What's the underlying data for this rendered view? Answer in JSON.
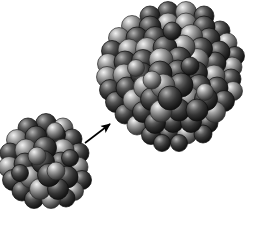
{
  "figure": {
    "caption": "Small spherical atomic cluster transforming into a larger spherical atomic cluster",
    "background_color": "#ffffff",
    "width": 254,
    "height": 231
  },
  "palette": {
    "background": "#ffffff",
    "sphere_dark_base": "#2b2b2b",
    "sphere_dark_highlight": "#9a9a9a",
    "sphere_dark_edge": "#0d0d0d",
    "sphere_light_base": "#6e6e6e",
    "sphere_light_highlight": "#e2e2e2",
    "sphere_light_edge": "#2a2a2a",
    "arrow_color": "#000000"
  },
  "objects": {
    "small_cluster": {
      "label": "small atomic cluster",
      "center_x": 47,
      "center_y": 160,
      "radius": 42,
      "atom_count": 34,
      "atom_radius": 10.5
    },
    "large_cluster": {
      "label": "large atomic cluster",
      "center_x": 176,
      "center_y": 78,
      "radius": 68,
      "atom_count": 78,
      "atom_radius": 10.5
    },
    "arrow": {
      "label": "growth-transformation arrow",
      "x1": 85,
      "y1": 143,
      "x2": 110,
      "y2": 124,
      "stroke_width": 1.6,
      "head_length": 11,
      "head_width": 7
    }
  },
  "clusters": {
    "small": {
      "atoms": [
        {
          "x": 28,
          "y": 128,
          "r": 10.0,
          "tone": "dark",
          "depth": 0
        },
        {
          "x": 46,
          "y": 124,
          "r": 10.5,
          "tone": "dark",
          "depth": 0
        },
        {
          "x": 63,
          "y": 128,
          "r": 10.0,
          "tone": "light",
          "depth": 0
        },
        {
          "x": 17,
          "y": 140,
          "r": 10.5,
          "tone": "light",
          "depth": 0
        },
        {
          "x": 36,
          "y": 137,
          "r": 11.0,
          "tone": "dark",
          "depth": 1
        },
        {
          "x": 55,
          "y": 135,
          "r": 10.5,
          "tone": "dark",
          "depth": 1
        },
        {
          "x": 72,
          "y": 139,
          "r": 10.0,
          "tone": "dark",
          "depth": 0
        },
        {
          "x": 10,
          "y": 153,
          "r": 10.0,
          "tone": "dark",
          "depth": 0
        },
        {
          "x": 26,
          "y": 150,
          "r": 11.0,
          "tone": "light",
          "depth": 1
        },
        {
          "x": 45,
          "y": 148,
          "r": 11.5,
          "tone": "dark",
          "depth": 2
        },
        {
          "x": 63,
          "y": 150,
          "r": 11.0,
          "tone": "light",
          "depth": 1
        },
        {
          "x": 79,
          "y": 153,
          "r": 10.0,
          "tone": "dark",
          "depth": 0
        },
        {
          "x": 9,
          "y": 167,
          "r": 10.5,
          "tone": "light",
          "depth": 0
        },
        {
          "x": 25,
          "y": 164,
          "r": 11.0,
          "tone": "dark",
          "depth": 1
        },
        {
          "x": 43,
          "y": 162,
          "r": 11.5,
          "tone": "dark",
          "depth": 2
        },
        {
          "x": 61,
          "y": 163,
          "r": 11.0,
          "tone": "dark",
          "depth": 1
        },
        {
          "x": 78,
          "y": 167,
          "r": 10.0,
          "tone": "light",
          "depth": 0
        },
        {
          "x": 13,
          "y": 180,
          "r": 10.5,
          "tone": "dark",
          "depth": 0
        },
        {
          "x": 31,
          "y": 177,
          "r": 11.0,
          "tone": "light",
          "depth": 1
        },
        {
          "x": 49,
          "y": 175,
          "r": 11.5,
          "tone": "dark",
          "depth": 2
        },
        {
          "x": 67,
          "y": 177,
          "r": 11.0,
          "tone": "dark",
          "depth": 1
        },
        {
          "x": 82,
          "y": 180,
          "r": 9.5,
          "tone": "dark",
          "depth": 0
        },
        {
          "x": 22,
          "y": 191,
          "r": 10.0,
          "tone": "dark",
          "depth": 0
        },
        {
          "x": 40,
          "y": 189,
          "r": 10.5,
          "tone": "light",
          "depth": 1
        },
        {
          "x": 58,
          "y": 189,
          "r": 10.5,
          "tone": "dark",
          "depth": 1
        },
        {
          "x": 74,
          "y": 191,
          "r": 9.5,
          "tone": "light",
          "depth": 0
        },
        {
          "x": 34,
          "y": 199,
          "r": 9.5,
          "tone": "dark",
          "depth": 0
        },
        {
          "x": 51,
          "y": 199,
          "r": 9.5,
          "tone": "light",
          "depth": 0
        },
        {
          "x": 66,
          "y": 198,
          "r": 9.0,
          "tone": "dark",
          "depth": 0
        },
        {
          "x": 55,
          "y": 131,
          "r": 8.5,
          "tone": "light",
          "depth": 3
        },
        {
          "x": 37,
          "y": 156,
          "r": 9.0,
          "tone": "light",
          "depth": 3
        },
        {
          "x": 56,
          "y": 171,
          "r": 9.0,
          "tone": "light",
          "depth": 3
        },
        {
          "x": 20,
          "y": 173,
          "r": 8.5,
          "tone": "dark",
          "depth": 3
        },
        {
          "x": 70,
          "y": 158,
          "r": 8.5,
          "tone": "dark",
          "depth": 3
        }
      ]
    },
    "large": {
      "atoms": [
        {
          "x": 150,
          "y": 16,
          "r": 10.0,
          "tone": "dark",
          "depth": 0
        },
        {
          "x": 168,
          "y": 12,
          "r": 10.5,
          "tone": "dark",
          "depth": 0
        },
        {
          "x": 186,
          "y": 12,
          "r": 10.5,
          "tone": "light",
          "depth": 0
        },
        {
          "x": 204,
          "y": 16,
          "r": 10.0,
          "tone": "dark",
          "depth": 0
        },
        {
          "x": 132,
          "y": 26,
          "r": 10.5,
          "tone": "light",
          "depth": 0
        },
        {
          "x": 150,
          "y": 27,
          "r": 11.0,
          "tone": "dark",
          "depth": 1
        },
        {
          "x": 168,
          "y": 24,
          "r": 11.0,
          "tone": "light",
          "depth": 1
        },
        {
          "x": 186,
          "y": 24,
          "r": 11.0,
          "tone": "light",
          "depth": 1
        },
        {
          "x": 204,
          "y": 27,
          "r": 11.0,
          "tone": "dark",
          "depth": 1
        },
        {
          "x": 220,
          "y": 31,
          "r": 10.0,
          "tone": "dark",
          "depth": 0
        },
        {
          "x": 119,
          "y": 38,
          "r": 10.5,
          "tone": "light",
          "depth": 0
        },
        {
          "x": 137,
          "y": 38,
          "r": 11.0,
          "tone": "dark",
          "depth": 1
        },
        {
          "x": 155,
          "y": 38,
          "r": 11.5,
          "tone": "dark",
          "depth": 2
        },
        {
          "x": 173,
          "y": 36,
          "r": 11.5,
          "tone": "dark",
          "depth": 2
        },
        {
          "x": 191,
          "y": 36,
          "r": 11.5,
          "tone": "light",
          "depth": 2
        },
        {
          "x": 209,
          "y": 39,
          "r": 11.0,
          "tone": "dark",
          "depth": 1
        },
        {
          "x": 227,
          "y": 43,
          "r": 10.0,
          "tone": "light",
          "depth": 0
        },
        {
          "x": 112,
          "y": 51,
          "r": 10.5,
          "tone": "dark",
          "depth": 0
        },
        {
          "x": 129,
          "y": 50,
          "r": 11.0,
          "tone": "light",
          "depth": 1
        },
        {
          "x": 147,
          "y": 49,
          "r": 11.5,
          "tone": "light",
          "depth": 2
        },
        {
          "x": 165,
          "y": 48,
          "r": 12.0,
          "tone": "dark",
          "depth": 3
        },
        {
          "x": 183,
          "y": 47,
          "r": 12.0,
          "tone": "light",
          "depth": 3
        },
        {
          "x": 201,
          "y": 49,
          "r": 11.5,
          "tone": "dark",
          "depth": 2
        },
        {
          "x": 219,
          "y": 52,
          "r": 11.0,
          "tone": "dark",
          "depth": 1
        },
        {
          "x": 235,
          "y": 56,
          "r": 9.5,
          "tone": "dark",
          "depth": 0
        },
        {
          "x": 108,
          "y": 64,
          "r": 10.5,
          "tone": "light",
          "depth": 0
        },
        {
          "x": 125,
          "y": 62,
          "r": 11.0,
          "tone": "dark",
          "depth": 1
        },
        {
          "x": 143,
          "y": 61,
          "r": 11.5,
          "tone": "dark",
          "depth": 2
        },
        {
          "x": 161,
          "y": 60,
          "r": 12.0,
          "tone": "light",
          "depth": 3
        },
        {
          "x": 179,
          "y": 59,
          "r": 12.0,
          "tone": "dark",
          "depth": 3
        },
        {
          "x": 197,
          "y": 60,
          "r": 11.5,
          "tone": "light",
          "depth": 2
        },
        {
          "x": 215,
          "y": 63,
          "r": 11.0,
          "tone": "dark",
          "depth": 1
        },
        {
          "x": 232,
          "y": 67,
          "r": 10.0,
          "tone": "light",
          "depth": 0
        },
        {
          "x": 107,
          "y": 77,
          "r": 10.5,
          "tone": "light",
          "depth": 0
        },
        {
          "x": 124,
          "y": 75,
          "r": 11.0,
          "tone": "light",
          "depth": 1
        },
        {
          "x": 142,
          "y": 74,
          "r": 11.5,
          "tone": "dark",
          "depth": 2
        },
        {
          "x": 160,
          "y": 73,
          "r": 12.0,
          "tone": "dark",
          "depth": 3
        },
        {
          "x": 178,
          "y": 72,
          "r": 12.0,
          "tone": "dark",
          "depth": 3
        },
        {
          "x": 196,
          "y": 73,
          "r": 11.5,
          "tone": "dark",
          "depth": 2
        },
        {
          "x": 214,
          "y": 76,
          "r": 11.0,
          "tone": "light",
          "depth": 1
        },
        {
          "x": 231,
          "y": 79,
          "r": 10.0,
          "tone": "dark",
          "depth": 0
        },
        {
          "x": 110,
          "y": 90,
          "r": 10.5,
          "tone": "dark",
          "depth": 0
        },
        {
          "x": 127,
          "y": 88,
          "r": 11.0,
          "tone": "dark",
          "depth": 1
        },
        {
          "x": 145,
          "y": 87,
          "r": 11.5,
          "tone": "light",
          "depth": 2
        },
        {
          "x": 163,
          "y": 86,
          "r": 12.0,
          "tone": "light",
          "depth": 3
        },
        {
          "x": 181,
          "y": 85,
          "r": 12.0,
          "tone": "dark",
          "depth": 3
        },
        {
          "x": 199,
          "y": 86,
          "r": 11.5,
          "tone": "dark",
          "depth": 2
        },
        {
          "x": 217,
          "y": 88,
          "r": 11.0,
          "tone": "dark",
          "depth": 1
        },
        {
          "x": 233,
          "y": 91,
          "r": 9.5,
          "tone": "light",
          "depth": 0
        },
        {
          "x": 116,
          "y": 102,
          "r": 10.5,
          "tone": "dark",
          "depth": 0
        },
        {
          "x": 134,
          "y": 100,
          "r": 11.0,
          "tone": "light",
          "depth": 1
        },
        {
          "x": 152,
          "y": 99,
          "r": 11.5,
          "tone": "dark",
          "depth": 2
        },
        {
          "x": 170,
          "y": 98,
          "r": 12.0,
          "tone": "dark",
          "depth": 3
        },
        {
          "x": 188,
          "y": 98,
          "r": 11.5,
          "tone": "light",
          "depth": 2
        },
        {
          "x": 206,
          "y": 99,
          "r": 11.5,
          "tone": "dark",
          "depth": 2
        },
        {
          "x": 224,
          "y": 101,
          "r": 10.5,
          "tone": "dark",
          "depth": 1
        },
        {
          "x": 125,
          "y": 114,
          "r": 10.0,
          "tone": "dark",
          "depth": 0
        },
        {
          "x": 143,
          "y": 112,
          "r": 10.5,
          "tone": "dark",
          "depth": 1
        },
        {
          "x": 161,
          "y": 111,
          "r": 11.0,
          "tone": "light",
          "depth": 2
        },
        {
          "x": 179,
          "y": 110,
          "r": 11.0,
          "tone": "dark",
          "depth": 2
        },
        {
          "x": 197,
          "y": 110,
          "r": 11.0,
          "tone": "dark",
          "depth": 2
        },
        {
          "x": 215,
          "y": 112,
          "r": 10.5,
          "tone": "light",
          "depth": 1
        },
        {
          "x": 137,
          "y": 125,
          "r": 10.0,
          "tone": "light",
          "depth": 0
        },
        {
          "x": 155,
          "y": 123,
          "r": 10.5,
          "tone": "dark",
          "depth": 1
        },
        {
          "x": 173,
          "y": 122,
          "r": 10.5,
          "tone": "dark",
          "depth": 1
        },
        {
          "x": 191,
          "y": 122,
          "r": 10.5,
          "tone": "dark",
          "depth": 1
        },
        {
          "x": 208,
          "y": 123,
          "r": 10.0,
          "tone": "dark",
          "depth": 0
        },
        {
          "x": 151,
          "y": 135,
          "r": 9.5,
          "tone": "dark",
          "depth": 0
        },
        {
          "x": 169,
          "y": 134,
          "r": 10.0,
          "tone": "dark",
          "depth": 0
        },
        {
          "x": 187,
          "y": 134,
          "r": 10.0,
          "tone": "light",
          "depth": 0
        },
        {
          "x": 203,
          "y": 134,
          "r": 9.0,
          "tone": "dark",
          "depth": 0
        },
        {
          "x": 162,
          "y": 143,
          "r": 8.5,
          "tone": "dark",
          "depth": 0
        },
        {
          "x": 179,
          "y": 143,
          "r": 8.5,
          "tone": "dark",
          "depth": 0
        },
        {
          "x": 172,
          "y": 31,
          "r": 9.0,
          "tone": "dark",
          "depth": 4
        },
        {
          "x": 190,
          "y": 66,
          "r": 9.0,
          "tone": "dark",
          "depth": 4
        },
        {
          "x": 152,
          "y": 80,
          "r": 9.0,
          "tone": "light",
          "depth": 4
        },
        {
          "x": 136,
          "y": 68,
          "r": 8.5,
          "tone": "light",
          "depth": 4
        },
        {
          "x": 205,
          "y": 92,
          "r": 8.5,
          "tone": "light",
          "depth": 4
        }
      ]
    }
  }
}
